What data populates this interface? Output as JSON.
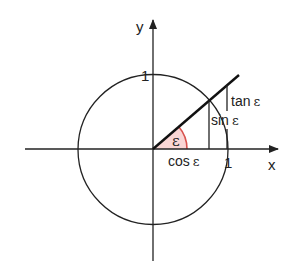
{
  "diagram": {
    "type": "unit-circle",
    "title": "",
    "axes": {
      "x_label": "x",
      "y_label": "y",
      "tick_x": "1",
      "tick_y": "1"
    },
    "angle": {
      "symbol": "ε",
      "degrees": 40.7
    },
    "labels": {
      "sin": "sin ε",
      "cos": "cos ε",
      "tan": "tan ε",
      "sin_fn": "sin",
      "cos_fn": "cos",
      "tan_fn": "tan",
      "eps": "ε"
    },
    "colors": {
      "stroke": "#222222",
      "angle_arc": "#d9534f",
      "angle_fill": "#f9d6d5",
      "background": "#ffffff"
    },
    "geometry": {
      "origin": [
        153,
        149
      ],
      "radius": 75
    }
  }
}
